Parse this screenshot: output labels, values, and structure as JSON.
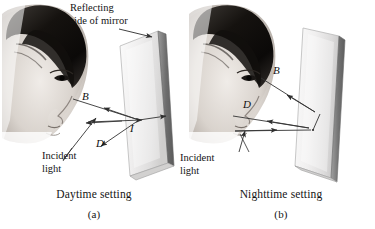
{
  "figure": {
    "background_color": "#ffffff",
    "ink_color": "#141414",
    "ray_color": "#3a3a3a",
    "mirror_glass_color": "#f2f2f2",
    "mirror_edge_color": "#8d8d8d",
    "mirror_dark_edge_color": "#6b6b6b",
    "width": 375,
    "height": 229
  },
  "panels": [
    {
      "id": "a",
      "letter": "(a)",
      "caption": "Daytime setting",
      "mirror_note": {
        "line1": "Reflecting",
        "line2": "side of mirror"
      },
      "incident_label": {
        "line1": "Incident",
        "line2": "light"
      },
      "ray_labels": [
        {
          "name": "B",
          "text": "B"
        },
        {
          "name": "D",
          "text": "D"
        },
        {
          "name": "I",
          "text": "I"
        }
      ]
    },
    {
      "id": "b",
      "letter": "(b)",
      "caption": "Nighttime setting",
      "incident_label": {
        "line1": "Incident",
        "line2": "light"
      },
      "ray_labels": [
        {
          "name": "B",
          "text": "B"
        },
        {
          "name": "D",
          "text": "D"
        }
      ]
    }
  ]
}
